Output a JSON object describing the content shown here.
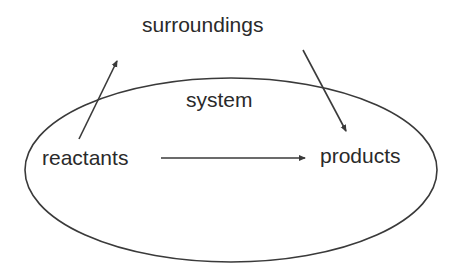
{
  "labels": {
    "surroundings": "surroundings",
    "system": "system",
    "reactants": "reactants",
    "products": "products"
  },
  "colors": {
    "stroke": "#3a3a3a",
    "text": "#2a2a2a",
    "background": "#ffffff"
  },
  "arrows": [
    {
      "from": "reactants",
      "to": "surroundings"
    },
    {
      "from": "surroundings",
      "to": "products"
    },
    {
      "from": "reactants",
      "to": "products"
    }
  ]
}
